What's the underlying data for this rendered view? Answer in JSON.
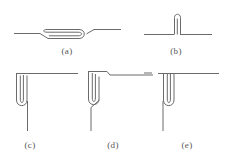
{
  "figure": {
    "kind": "technical-line-drawing",
    "caption_style": "parenthesized-lowercase-letters",
    "background_color": "#ffffff",
    "line_color": "#6b6b6b",
    "label_color": "#555555",
    "line_width_px": 1,
    "labels": [
      {
        "id": "a",
        "text": "(a)"
      },
      {
        "id": "b",
        "text": "(b)"
      },
      {
        "id": "c",
        "text": "(c)"
      },
      {
        "id": "d",
        "text": "(d)"
      },
      {
        "id": "e",
        "text": "(e)"
      }
    ],
    "subfigures": [
      {
        "id": "a",
        "label": "(a)",
        "description": "horizontal line with a long flattened hairpin fold in the middle",
        "orientation": "horizontal"
      },
      {
        "id": "b",
        "label": "(b)",
        "description": "horizontal line with a short vertical hairpin loop standing upward at the centre",
        "orientation": "horizontal"
      },
      {
        "id": "c",
        "label": "(c)",
        "description": "right-angle corner with a vertical hairpin loop hanging at the corner",
        "orientation": "corner"
      },
      {
        "id": "d",
        "label": "(d)",
        "description": "right-angle corner with an offset step and a vertical hairpin loop at the corner",
        "orientation": "corner"
      },
      {
        "id": "e",
        "label": "(e)",
        "description": "right-angle corner with a vertical hairpin loop hanging below the corner and a short detached dash at upper left",
        "orientation": "corner"
      }
    ]
  }
}
